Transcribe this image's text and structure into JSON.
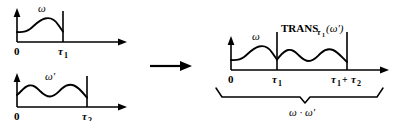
{
  "figure": {
    "title": "",
    "arrow": "→",
    "panels": [
      {
        "id": "omega-panel",
        "curve_label": "ω",
        "origin_label": "0",
        "end_tick_label": "τ",
        "end_tick_sub": "1"
      },
      {
        "id": "omega-prime-panel",
        "curve_label": "ω′",
        "origin_label": "0",
        "end_tick_label": "τ",
        "end_tick_sub": "2"
      },
      {
        "id": "concatenation-panel",
        "curve_label_first": "ω",
        "trans_label_main": "TRANS",
        "trans_label_sub": "τ",
        "trans_label_sub2": "1",
        "trans_label_arg": "(ω′)",
        "origin_label": "0",
        "mid_tick_label": "τ",
        "mid_tick_sub": "1",
        "end_tick_label_a": "τ",
        "end_tick_sub_a": "1",
        "end_tick_plus": "+",
        "end_tick_label_b": "τ",
        "end_tick_sub_b": "2",
        "brace_label": "ω · ω′"
      }
    ],
    "colors": {
      "ink": "#000000",
      "background": "#ffffff"
    }
  }
}
